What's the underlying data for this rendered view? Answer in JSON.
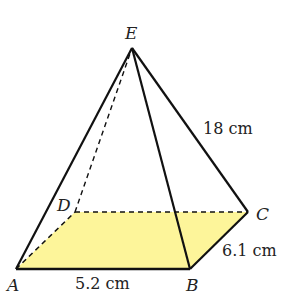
{
  "diagram": {
    "type": "square-based pyramid (rectangular base)",
    "colors": {
      "base_fill": "#fdf59a",
      "edge": "#111111"
    },
    "vertices": {
      "A": {
        "label": "A",
        "x": 16,
        "y": 269
      },
      "B": {
        "label": "B",
        "x": 190,
        "y": 269
      },
      "C": {
        "label": "C",
        "x": 248,
        "y": 212
      },
      "D": {
        "label": "D",
        "x": 75,
        "y": 212
      },
      "E": {
        "label": "E",
        "x": 132,
        "y": 48
      }
    },
    "measurements": {
      "AB": "5.2 cm",
      "BC": "6.1 cm",
      "EC": "18 cm"
    },
    "hidden_edges": [
      "AD",
      "DC",
      "DE"
    ],
    "visible_edges": [
      "AB",
      "BC",
      "EA",
      "EB",
      "EC"
    ]
  }
}
